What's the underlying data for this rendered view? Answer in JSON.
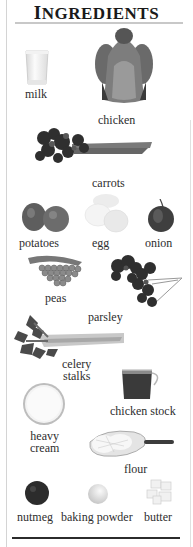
{
  "title": "Ingredients",
  "title_first": "I",
  "title_rest": "NGREDIENTS",
  "colors": {
    "text": "#2e2e2e",
    "top_rule": "#c8c8c8",
    "bottom_rule": "#2b2b2b",
    "frame": "#d4d4d4"
  },
  "ingredients": [
    {
      "name": "milk",
      "icon": "milk-glass-icon"
    },
    {
      "name": "chicken",
      "icon": "whole-chicken-icon"
    },
    {
      "name": "carrots",
      "icon": "carrots-bunch-icon"
    },
    {
      "name": "potatoes",
      "icon": "potatoes-icon"
    },
    {
      "name": "egg",
      "icon": "eggs-icon"
    },
    {
      "name": "onion",
      "icon": "onion-icon"
    },
    {
      "name": "peas",
      "icon": "peas-icon"
    },
    {
      "name": "parsley",
      "icon": "parsley-icon"
    },
    {
      "name": "celery",
      "name_line2": "stalks",
      "icon": "celery-icon"
    },
    {
      "name": "chicken stock",
      "icon": "chicken-stock-cup-icon"
    },
    {
      "name": "heavy",
      "name_line2": "cream",
      "icon": "heavy-cream-dish-icon"
    },
    {
      "name": "flour",
      "icon": "flour-scoop-icon"
    },
    {
      "name": "nutmeg",
      "icon": "nutmeg-icon"
    },
    {
      "name": "baking powder",
      "icon": "baking-powder-icon"
    },
    {
      "name": "butter",
      "icon": "butter-cubes-icon"
    }
  ]
}
